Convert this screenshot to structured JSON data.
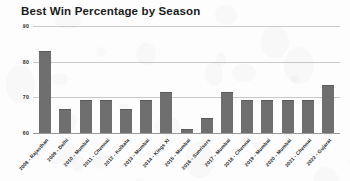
{
  "chart_data": {
    "type": "bar",
    "title": "Best Win Percentage by Season",
    "xlabel": "",
    "ylabel": "",
    "ylim": [
      60,
      90
    ],
    "yticks": [
      60,
      70,
      80,
      90
    ],
    "grid": true,
    "legend": "none",
    "bar_color": "#6f6f6f",
    "categories": [
      "2008 - Rajasthan",
      "2009 - Delhi",
      "2010 - Mumbai",
      "2011 - Chennai",
      "2012 - Kolkata",
      "2013 - Mumbai",
      "2014 - Kings XI",
      "2015 - Mumbai",
      "2016 - Sunrisers",
      "2017 - Mumbai",
      "2018 - Chennai",
      "2019 - Mumbai",
      "2020 - Mumbai",
      "2021 - Chennai",
      "2022 - Gujarat"
    ],
    "values": [
      82.9,
      66.7,
      69.2,
      69.2,
      66.7,
      69.2,
      71.4,
      61.1,
      64.3,
      71.4,
      69.2,
      69.2,
      69.2,
      69.2,
      73.6
    ]
  }
}
